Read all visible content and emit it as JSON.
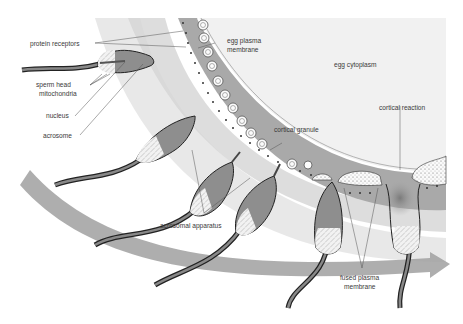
{
  "diagram": {
    "colors": {
      "egg_cytoplasm": "#f1f1f1",
      "zona_band": "#a8a8a8",
      "light_band": "#d9d9d9",
      "arrow_band": "#9a9a9a",
      "sperm_body": "#8e8e8e",
      "outline": "#222222",
      "label_text": "#3a3a3a"
    },
    "labels": {
      "protein_receptors": "protein receptors",
      "sperm_head": "sperm head",
      "mitochondria": "mitochondria",
      "nucleus": "nucleus",
      "acrosome": "acrosome",
      "egg_plasma_membrane_1": "egg plasma",
      "egg_plasma_membrane_2": "membrane",
      "egg_cytoplasm": "egg cytoplasm",
      "cortical_granule": "cortical granule",
      "cortical_reaction": "cortical reaction",
      "acrosomal_apparatus": "acrosomal apparatus",
      "fused_plasma_membrane_1": "fused plasma",
      "fused_plasma_membrane_2": "membrane"
    },
    "stages": [
      {
        "name": "sperm-approaching",
        "order": 1
      },
      {
        "name": "sperm-binding-receptor",
        "order": 2
      },
      {
        "name": "acrosome-reaction-1",
        "order": 3
      },
      {
        "name": "acrosome-reaction-2",
        "order": 4
      },
      {
        "name": "membrane-fusion",
        "order": 5
      },
      {
        "name": "cortical-reaction",
        "order": 6
      }
    ]
  }
}
